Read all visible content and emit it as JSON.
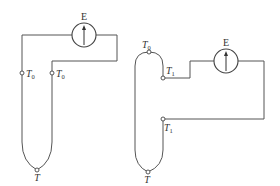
{
  "diagram": {
    "type": "thermocouple-circuits",
    "colors": {
      "line": "#555555",
      "background": "#ffffff"
    },
    "left_circuit": {
      "meter_label": "E",
      "meter_icon": "galvanometer-arrow-up",
      "junctions": [
        {
          "name": "reference-left",
          "label_main": "T",
          "label_sub": "0"
        },
        {
          "name": "reference-right",
          "label_main": "T",
          "label_sub": "0"
        },
        {
          "name": "measuring",
          "label_main": "T",
          "label_sub": ""
        }
      ]
    },
    "right_circuit": {
      "meter_label": "E",
      "meter_icon": "galvanometer-arrow-up",
      "junctions": [
        {
          "name": "reference-top",
          "label_main": "T",
          "label_sub": "0"
        },
        {
          "name": "intermediate-upper",
          "label_main": "T",
          "label_sub": "1"
        },
        {
          "name": "intermediate-lower",
          "label_main": "T",
          "label_sub": "1"
        },
        {
          "name": "measuring",
          "label_main": "T",
          "label_sub": ""
        }
      ]
    }
  }
}
